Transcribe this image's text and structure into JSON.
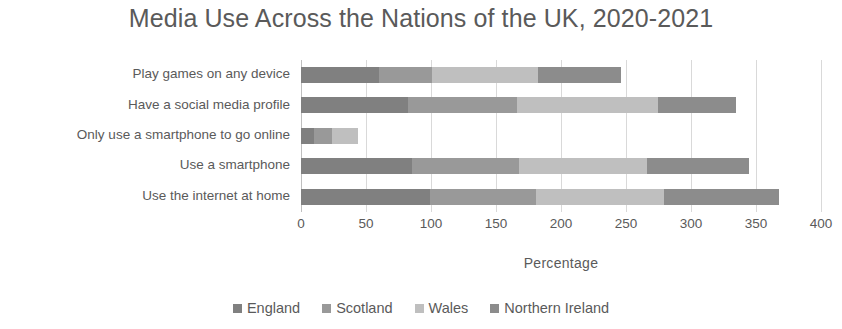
{
  "chart_data": {
    "type": "bar",
    "orientation": "horizontal",
    "stacked": true,
    "title": "Media Use Across the Nations of the UK, 2020-2021",
    "xlabel": "Percentage",
    "ylabel": "",
    "xlim": [
      0,
      400
    ],
    "xticks": [
      0,
      50,
      100,
      150,
      200,
      250,
      300,
      350,
      400
    ],
    "grid": true,
    "legend_position": "bottom",
    "categories": [
      "Play games on any device",
      "Have a social media profile",
      "Only use a smartphone to go online",
      "Use a smartphone",
      "Use the internet at home"
    ],
    "series": [
      {
        "name": "England",
        "color": "#808080",
        "values": [
          60,
          82,
          10,
          85,
          99
        ]
      },
      {
        "name": "Scotland",
        "color": "#999999",
        "values": [
          41,
          84,
          14,
          83,
          82
        ]
      },
      {
        "name": "Wales",
        "color": "#bfbfbf",
        "values": [
          81,
          109,
          20,
          98,
          98
        ]
      },
      {
        "name": "Northern Ireland",
        "color": "#8c8c8c",
        "values": [
          64,
          60,
          0,
          79,
          89
        ]
      }
    ],
    "totals": [
      246,
      335,
      44,
      345,
      368
    ]
  },
  "axis": {
    "tick_label_0": "0",
    "tick_label_1": "50",
    "tick_label_2": "100",
    "tick_label_3": "150",
    "tick_label_4": "200",
    "tick_label_5": "250",
    "tick_label_6": "300",
    "tick_label_7": "350",
    "tick_label_8": "400"
  }
}
